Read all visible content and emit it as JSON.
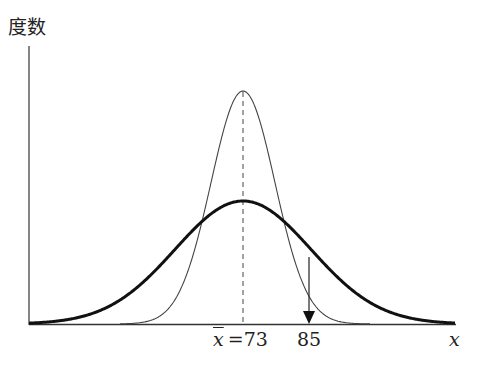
{
  "diagram": {
    "y_axis_label": "度数",
    "x_axis_label": "x",
    "mean_label": "x̄ =73",
    "mean_symbol": "x",
    "mean_eq": "=73",
    "marker_label": "85",
    "curves": [
      {
        "name": "narrow-distribution",
        "mean": 73,
        "stroke": "thin"
      },
      {
        "name": "wide-distribution",
        "mean": 73,
        "stroke": "thick"
      }
    ],
    "arrow_at": 85
  }
}
